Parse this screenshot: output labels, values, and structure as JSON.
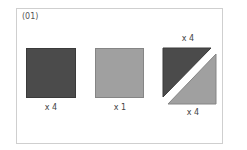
{
  "figure": {
    "title": "(01)",
    "colors": {
      "dark": "#4b4b4b",
      "light": "#a0a0a0",
      "border": "#cfcfcf"
    },
    "items": [
      {
        "shape": "dark-square",
        "label": "x 4"
      },
      {
        "shape": "light-square",
        "label": "x 1"
      },
      {
        "shape": "split-half-square",
        "label_top": "x 4",
        "label_bottom": "x 4"
      }
    ]
  }
}
